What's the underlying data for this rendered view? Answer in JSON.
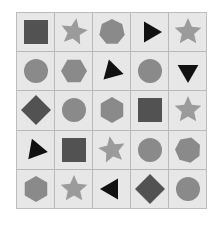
{
  "colors": {
    "cell_bg": "#e7e7e7",
    "grid_line": "#b9b9b9",
    "dark": "#525252",
    "gray": "#8a8a8a",
    "light": "#9b9b9b",
    "black": "#111111"
  },
  "grid": {
    "rows": 5,
    "cols": 5,
    "cells": [
      [
        {
          "shape": "square",
          "color": "dark",
          "rotation": 0
        },
        {
          "shape": "star",
          "color": "light",
          "rotation": 10
        },
        {
          "shape": "heptagon",
          "color": "gray",
          "rotation": 0
        },
        {
          "shape": "triangle",
          "color": "black",
          "rotation": 90
        },
        {
          "shape": "star",
          "color": "light",
          "rotation": 0
        }
      ],
      [
        {
          "shape": "circle",
          "color": "gray",
          "rotation": 0
        },
        {
          "shape": "hexagon",
          "color": "gray",
          "rotation": 90
        },
        {
          "shape": "triangle",
          "color": "black",
          "rotation": 105
        },
        {
          "shape": "circle",
          "color": "gray",
          "rotation": 0
        },
        {
          "shape": "triangle",
          "color": "black",
          "rotation": 180
        }
      ],
      [
        {
          "shape": "diamond",
          "color": "dark",
          "rotation": 0
        },
        {
          "shape": "circle",
          "color": "gray",
          "rotation": 0
        },
        {
          "shape": "hexagon",
          "color": "gray",
          "rotation": 0
        },
        {
          "shape": "square",
          "color": "dark",
          "rotation": 0
        },
        {
          "shape": "star",
          "color": "light",
          "rotation": 0
        }
      ],
      [
        {
          "shape": "triangle",
          "color": "black",
          "rotation": -20
        },
        {
          "shape": "square",
          "color": "dark",
          "rotation": 0
        },
        {
          "shape": "star",
          "color": "light",
          "rotation": -10
        },
        {
          "shape": "circle",
          "color": "gray",
          "rotation": 0
        },
        {
          "shape": "heptagon",
          "color": "gray",
          "rotation": 15
        }
      ],
      [
        {
          "shape": "hexagon",
          "color": "gray",
          "rotation": 0
        },
        {
          "shape": "star",
          "color": "light",
          "rotation": 0
        },
        {
          "shape": "triangle",
          "color": "black",
          "rotation": -90
        },
        {
          "shape": "diamond",
          "color": "dark",
          "rotation": 0
        },
        {
          "shape": "circle",
          "color": "gray",
          "rotation": 0
        }
      ]
    ]
  }
}
